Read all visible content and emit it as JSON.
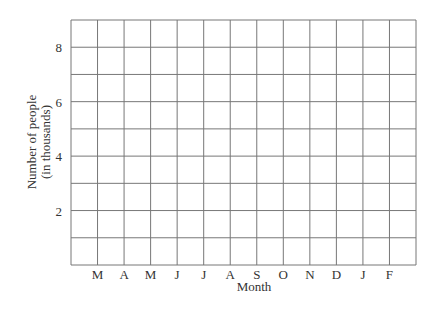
{
  "chart_data": {
    "type": "line",
    "title": "",
    "xlabel": "Month",
    "ylabel": "Number of people (in thousands)",
    "ylabel_lines": [
      "Number of people",
      "(in thousands)"
    ],
    "categories": [
      "M",
      "A",
      "M",
      "J",
      "J",
      "A",
      "S",
      "O",
      "N",
      "D",
      "J",
      "F"
    ],
    "series": [],
    "y_ticks": [
      "2",
      "4",
      "6",
      "8"
    ],
    "y_tick_values": [
      2,
      4,
      6,
      8
    ],
    "ylim": [
      0,
      9
    ],
    "grid": true,
    "grid_columns": 13,
    "grid_rows": 9,
    "legend": null,
    "note": "Blank grid with no plotted data"
  }
}
